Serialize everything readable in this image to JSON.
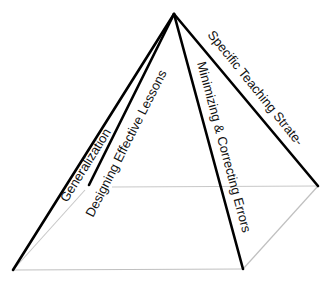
{
  "diagram": {
    "type": "pyramid",
    "faces": [
      {
        "label": "Generalization"
      },
      {
        "label": "Designing Effective Lessons"
      },
      {
        "label": "Minimizing & Correcting Errors"
      },
      {
        "label": "Specific Teaching Strate-"
      }
    ],
    "colors": {
      "edge": "#000000",
      "hidden_edge": "#c8c8c8",
      "text": "#111111",
      "background": "#ffffff"
    }
  }
}
